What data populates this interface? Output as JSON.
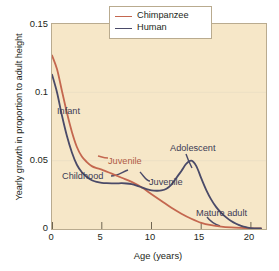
{
  "chart_data": {
    "type": "line",
    "title": "",
    "xlabel": "Age (years)",
    "ylabel": "Yearly growth in proportion to adult height",
    "xlim": [
      0,
      21.5
    ],
    "ylim": [
      0,
      0.15
    ],
    "xticks": [
      0,
      5,
      10,
      15,
      20
    ],
    "xtick_labels": [
      "0",
      "5",
      "10",
      "15",
      "20"
    ],
    "yticks": [
      0,
      0.05,
      0.1,
      0.15
    ],
    "ytick_labels": [
      "0",
      "0.05",
      "0.1",
      "0.15"
    ],
    "grid": "horizontal-faint",
    "legend_position": "top-right",
    "plot_background": "#f6e7c8",
    "series": [
      {
        "name": "Chimpanzee",
        "color": "#c4674f",
        "x": [
          0,
          0.5,
          1,
          1.5,
          2,
          2.5,
          3,
          3.5,
          4,
          4.5,
          5,
          6,
          7,
          8,
          9,
          10,
          11,
          12,
          13,
          14,
          15,
          16,
          17,
          18,
          19,
          20,
          21
        ],
        "y": [
          0.127,
          0.117,
          0.101,
          0.085,
          0.071,
          0.06,
          0.053,
          0.049,
          0.046,
          0.0445,
          0.0435,
          0.0405,
          0.0375,
          0.0345,
          0.0305,
          0.0255,
          0.0205,
          0.0155,
          0.0112,
          0.0075,
          0.0045,
          0.0028,
          0.0018,
          0.0012,
          0.0008,
          0.0005,
          0.0004
        ]
      },
      {
        "name": "Human",
        "color": "#4a4a68",
        "x": [
          0,
          0.5,
          1,
          1.5,
          2,
          2.5,
          3,
          3.5,
          4,
          4.5,
          5,
          5.5,
          6,
          6.5,
          7,
          7.5,
          8,
          8.5,
          9,
          9.5,
          10,
          10.5,
          11,
          11.5,
          12,
          12.5,
          13,
          13.5,
          14,
          14.5,
          15,
          15.5,
          16,
          16.5,
          17,
          17.5,
          18,
          18.5,
          19,
          19.5,
          20,
          21
        ],
        "y": [
          0.113,
          0.1,
          0.083,
          0.068,
          0.056,
          0.047,
          0.0415,
          0.038,
          0.0357,
          0.0345,
          0.0338,
          0.0335,
          0.0334,
          0.0334,
          0.0335,
          0.0333,
          0.0328,
          0.0318,
          0.0305,
          0.0292,
          0.0283,
          0.028,
          0.0282,
          0.0295,
          0.0325,
          0.0375,
          0.0425,
          0.0478,
          0.05,
          0.046,
          0.037,
          0.0285,
          0.0215,
          0.016,
          0.0118,
          0.0085,
          0.0058,
          0.0038,
          0.0023,
          0.0013,
          0.0007,
          0.0004
        ]
      }
    ],
    "annotations": [
      {
        "text": "Infant",
        "color": "#3b3b55",
        "x_px": 57,
        "y_px": 107
      },
      {
        "text": "Juvenile",
        "color": "#b05a45",
        "x_px": 108,
        "y_px": 157
      },
      {
        "text": "Childhood",
        "color": "#3b3b55",
        "x_px": 62,
        "y_px": 172
      },
      {
        "text": "Juvenile",
        "color": "#3b3b55",
        "x_px": 149,
        "y_px": 178
      },
      {
        "text": "Adolescent",
        "color": "#3b3b55",
        "x_px": 170,
        "y_px": 144
      },
      {
        "text": "Mature adult",
        "color": "#3b3b55",
        "x_px": 196,
        "y_px": 209
      }
    ]
  },
  "legend": {
    "items": [
      {
        "label": "Chimpanzee",
        "color": "#c4674f"
      },
      {
        "label": "Human",
        "color": "#4a4a68"
      }
    ]
  }
}
